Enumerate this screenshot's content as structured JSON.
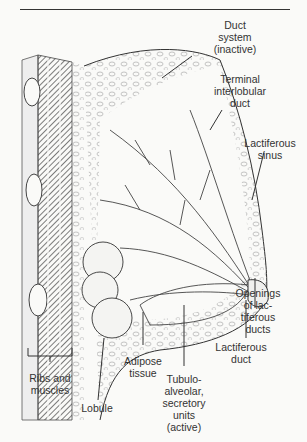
{
  "figure": {
    "labels": {
      "duct_system": "Duct\nsystem\n(inactive)",
      "terminal_duct": "Terminal\ninterlobular\nduct",
      "lactiferous_sinus": "Lactiferous\nsinus",
      "openings": "Openings\nof lac-\ntiferous\nducts",
      "lactiferous_duct": "Lactiferous\nduct",
      "tubulo": "Tubulo-\nalveolar,\nsecretory\nunits\n(active)",
      "adipose": "Adipose\ntissue",
      "lobule": "Lobule",
      "ribs": "Ribs and\nmuscles"
    },
    "signature": "Gershwin",
    "colors": {
      "ink": "#333333",
      "paper": "#fafaf8",
      "hatch": "#555555"
    }
  }
}
